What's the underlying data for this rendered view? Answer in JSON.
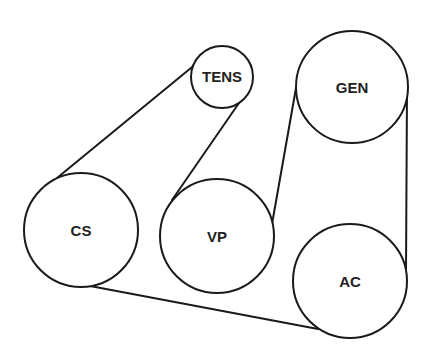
{
  "diagram": {
    "type": "serpentine-belt-routing",
    "colors": {
      "line": "#1a1a1a",
      "text": "#222222",
      "background": "#ffffff"
    },
    "pulleys": [
      {
        "id": "tens",
        "label": "TENS",
        "cx": 222,
        "cy": 77,
        "r": 31
      },
      {
        "id": "gen",
        "label": "GEN",
        "cx": 352,
        "cy": 87,
        "r": 56
      },
      {
        "id": "cs",
        "label": "CS",
        "cx": 81,
        "cy": 230,
        "r": 57
      },
      {
        "id": "vp",
        "label": "VP",
        "cx": 217,
        "cy": 236,
        "r": 57
      },
      {
        "id": "ac",
        "label": "AC",
        "cx": 350,
        "cy": 281,
        "r": 57
      }
    ],
    "belt_segments": [
      {
        "from": "cs",
        "to": "tens",
        "x1": 57,
        "y1": 178,
        "x2": 197,
        "y2": 63
      },
      {
        "from": "tens",
        "to": "vp",
        "x1": 239,
        "y1": 103,
        "x2": 172,
        "y2": 200
      },
      {
        "from": "vp",
        "to": "gen",
        "x1": 272,
        "y1": 224,
        "x2": 296,
        "y2": 88
      },
      {
        "from": "gen",
        "to": "ac",
        "x1": 407,
        "y1": 90,
        "x2": 406,
        "y2": 270
      },
      {
        "from": "ac",
        "to": "cs",
        "x1": 318,
        "y1": 329,
        "x2": 90,
        "y2": 286
      }
    ]
  }
}
